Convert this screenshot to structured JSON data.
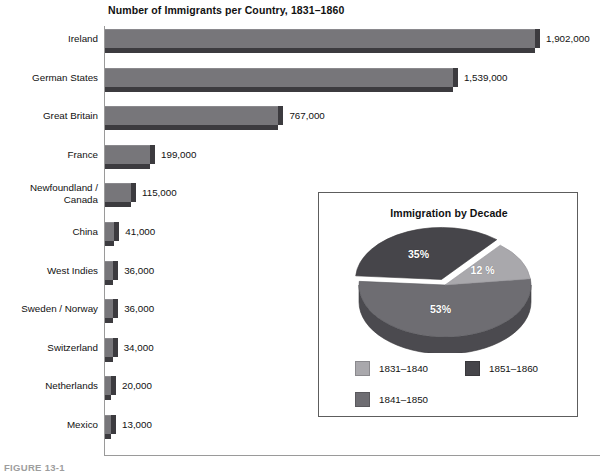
{
  "figure": {
    "caption": "FIGURE 13-1"
  },
  "bar_chart": {
    "title": "Number of Immigrants per Country, 1831–1860",
    "axis_color": "#9a9a9a",
    "bar_color": "#77767a",
    "bar_shadow_color": "#3c3b3f"
  },
  "pie_panel": {
    "title": "Immigration by Decade",
    "border_color": "#5d5d5d",
    "legend": [
      {
        "label": "1831–1840",
        "color": "#a9a8ac"
      },
      {
        "label": "1851–1860",
        "color": "#46454a"
      },
      {
        "label": "1841–1850",
        "color": "#6e6d72"
      }
    ]
  },
  "chart_data": [
    {
      "type": "bar",
      "title": "Number of Immigrants per Country, 1831–1860",
      "xlabel": "",
      "ylabel": "",
      "orientation": "horizontal",
      "grid": false,
      "xlim": [
        0,
        1902000
      ],
      "categories": [
        "Ireland",
        "German States",
        "Great Britain",
        "France",
        "Newfoundland /\nCanada",
        "China",
        "West Indies",
        "Sweden / Norway",
        "Switzerland",
        "Netherlands",
        "Mexico"
      ],
      "values": [
        1902000,
        1539000,
        767000,
        199000,
        115000,
        41000,
        36000,
        36000,
        34000,
        20000,
        13000
      ],
      "value_labels": [
        "1,902,000",
        "1,539,000",
        "767,000",
        "199,000",
        "115,000",
        "41,000",
        "36,000",
        "36,000",
        "34,000",
        "20,000",
        "13,000"
      ]
    },
    {
      "type": "pie",
      "title": "Immigration by Decade",
      "legend_position": "bottom",
      "labels": [
        "1831–1840",
        "1841–1850",
        "1851–1860"
      ],
      "values": [
        12,
        53,
        35
      ],
      "data_labels": [
        "12 %",
        "53%",
        "35%"
      ],
      "colors": [
        "#a9a8ac",
        "#6e6d72",
        "#46454a"
      ],
      "exploded": [
        "1851–1860"
      ]
    }
  ]
}
